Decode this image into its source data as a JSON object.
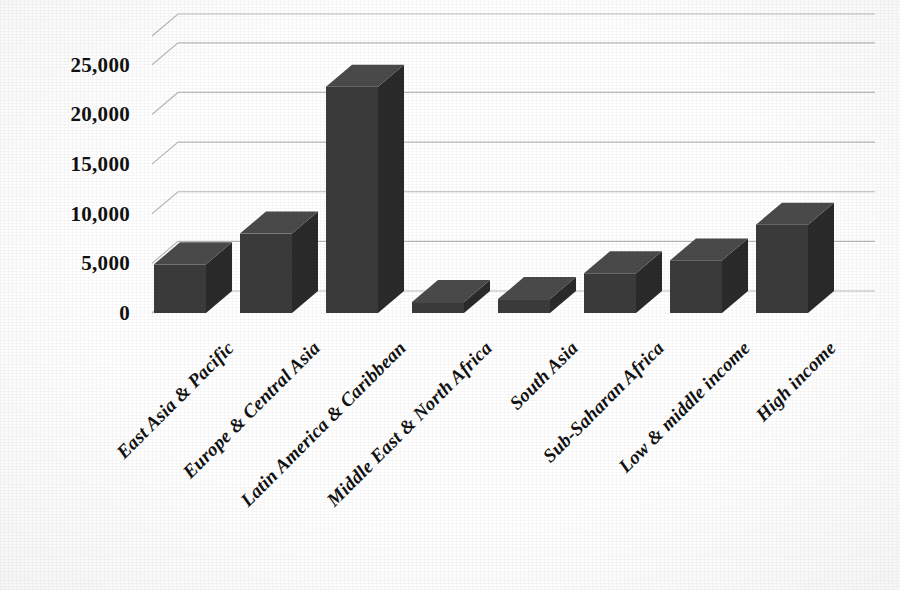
{
  "chart_data": {
    "type": "bar",
    "title": "",
    "subtitle": "",
    "xlabel": "",
    "ylabel": "",
    "categories": [
      "East Asia & Pacific",
      "Europe & Central Asia",
      "Latin America & Caribbean",
      "Middle East & North Africa",
      "South Asia",
      "Sub-Saharan Africa",
      "Low & middle income",
      "High income"
    ],
    "values": [
      4900,
      8000,
      22800,
      1100,
      1400,
      4000,
      5300,
      8900
    ],
    "ylim": [
      0,
      27500
    ],
    "yticks": [
      0,
      5000,
      10000,
      15000,
      20000,
      25000
    ],
    "ytick_labels": [
      "0",
      "5,000",
      "10,000",
      "15,000",
      "20,000",
      "25,000"
    ],
    "grid": true,
    "grid_axis": "y",
    "legend": false,
    "legend_position": "none",
    "style": "3d-column",
    "annotations": []
  },
  "colors": {
    "bar_front": "#3b3b3b",
    "bar_top": "#4a4a4a",
    "bar_side": "#2a2a2a",
    "gridline": "#b9b9b9",
    "axis_text": "#111111",
    "background": "#ffffff"
  }
}
